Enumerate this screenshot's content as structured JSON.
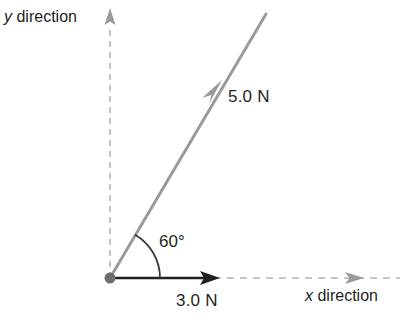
{
  "figure": {
    "type": "force-vector-diagram",
    "background_color": "#ffffff",
    "colors": {
      "vector_gray": "#9a9a9a",
      "axis_dash_gray": "#b3b3b3",
      "solid_black": "#231f20",
      "origin_dot": "#6d6e71",
      "arc_gray": "#3a3a3a"
    }
  },
  "axes": {
    "y": {
      "label_italic": "y",
      "label_rest": " direction",
      "style": "dashed",
      "arrow": "up",
      "arrow_color": "#9a9a9a"
    },
    "x": {
      "label_italic": "x",
      "label_rest": " direction",
      "style": "dashed",
      "arrow": "right",
      "arrow_color": "#9a9a9a"
    }
  },
  "origin": {
    "label": "origin-dot",
    "x": 110,
    "y": 278
  },
  "vectors": [
    {
      "name": "resultant-force-vector",
      "magnitude_label": "5.0 N",
      "magnitude": 5.0,
      "unit": "N",
      "angle_deg": 60,
      "color": "#9a9a9a",
      "arrow_position": "midpoint",
      "start": [
        110,
        278
      ],
      "end": [
        266,
        14
      ]
    },
    {
      "name": "horizontal-force-vector",
      "magnitude_label": "3.0 N",
      "magnitude": 3.0,
      "unit": "N",
      "angle_deg": 0,
      "color": "#231f20",
      "arrow_position": "end",
      "start": [
        110,
        278
      ],
      "end": [
        218,
        278
      ]
    }
  ],
  "angle": {
    "name": "angle-between-vectors",
    "label": "60°",
    "value_deg": 60,
    "arc_radius": 50,
    "from": "x-axis",
    "to": "resultant-force-vector"
  }
}
